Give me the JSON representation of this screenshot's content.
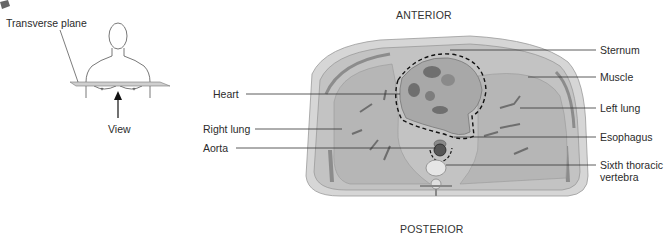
{
  "orientation_figure": {
    "plane_label": "Transverse plane",
    "view_label": "View",
    "icon": "transverse-plane-orientation-icon"
  },
  "section": {
    "top_label": "ANTERIOR",
    "bottom_label": "POSTERIOR"
  },
  "labels_left": [
    {
      "text": "Heart"
    },
    {
      "text": "Right lung"
    },
    {
      "text": "Aorta"
    }
  ],
  "labels_right": [
    {
      "text": "Sternum"
    },
    {
      "text": "Muscle"
    },
    {
      "text": "Left lung"
    },
    {
      "text": "Esophagus"
    },
    {
      "text": "Sixth thoracic"
    },
    {
      "text": "vertebra"
    }
  ],
  "colors": {
    "tissue": "#bdbdbd",
    "dark_tissue": "#7a7a7a",
    "skin": "#d2d2d2",
    "leader_line": "#333333"
  }
}
